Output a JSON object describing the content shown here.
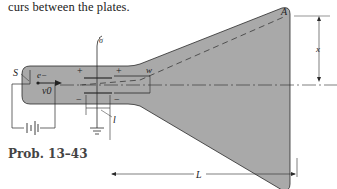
{
  "text": {
    "caption_fragment": "curs between the plates.",
    "problem_label": "Prob. 13–43"
  },
  "diagram": {
    "labels": {
      "source": "S",
      "electron": "e−",
      "initial_velocity": "v0",
      "screen_point": "A",
      "plate_gap": "w",
      "plate_length": "l",
      "screen_distance": "L",
      "deflection": "x",
      "plus_left": "+",
      "plus_right": "+",
      "minus_left": "−",
      "minus_right": "−"
    },
    "colors": {
      "tube_fill": "#a9a9a9",
      "line": "#2a2a2a"
    }
  }
}
